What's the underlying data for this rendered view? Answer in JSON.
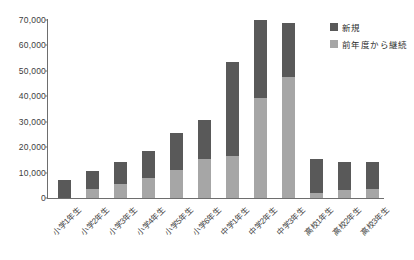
{
  "chart_data": {
    "type": "bar",
    "subtype": "stacked-vertical",
    "title": "",
    "xlabel": "",
    "ylabel": "",
    "ylim": [
      0,
      70000
    ],
    "ytick_values": [
      0,
      10000,
      20000,
      30000,
      40000,
      50000,
      60000,
      70000
    ],
    "ytick_labels": [
      "0",
      "10,000",
      "20,000",
      "30,000",
      "40,000",
      "50,000",
      "60,000",
      "70,000"
    ],
    "grid": false,
    "legend_position": "top-right",
    "categories": [
      "小学1年生",
      "小学2年生",
      "小学3年生",
      "小学4年生",
      "小学5年生",
      "小学6年生",
      "中学1年生",
      "中学2年生",
      "中学3年生",
      "高校1年生",
      "高校2年生",
      "高校3年生"
    ],
    "series": [
      {
        "name": "前年度から継続",
        "color": "#a6a6a6",
        "values": [
          0,
          3500,
          5500,
          8000,
          11000,
          15500,
          16500,
          39500,
          47500,
          2000,
          3000,
          3500
        ]
      },
      {
        "name": "新規",
        "color": "#595959",
        "values": [
          7000,
          7000,
          8500,
          10500,
          14500,
          15000,
          37000,
          30700,
          21500,
          13500,
          11000,
          10500
        ]
      }
    ],
    "totals": [
      7000,
      10500,
      14000,
      18500,
      25500,
      30500,
      53500,
      70200,
      69000,
      15500,
      14000,
      14000
    ]
  },
  "legend": {
    "items": [
      {
        "label": "新規",
        "color": "#595959"
      },
      {
        "label": "前年度から継続",
        "color": "#a6a6a6"
      }
    ]
  },
  "colors": {
    "new": "#595959",
    "continued": "#a6a6a6",
    "axis": "#6e6e6e",
    "text": "#3d3d3d",
    "background": "#ffffff"
  }
}
